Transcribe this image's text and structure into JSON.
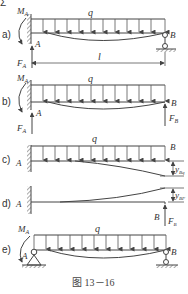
{
  "figure": {
    "caption": "图 13－16",
    "header_mark": "Σ"
  },
  "panels": [
    {
      "id": "a",
      "label": "a)",
      "load": "q",
      "moment": "M",
      "moment_sub": "A",
      "left": "A",
      "right": "B",
      "force": "F",
      "force_sub": "A",
      "length": "l"
    },
    {
      "id": "b",
      "label": "b)",
      "load": "q",
      "moment": "M",
      "moment_sub": "A",
      "left": "A",
      "right": "B",
      "force_left": "F",
      "force_left_sub": "A",
      "force_right": "F",
      "force_right_sub": "B"
    },
    {
      "id": "c",
      "label": "c)",
      "load": "q",
      "left": "A",
      "right": "B",
      "defl": "y",
      "defl_sub": "Bq"
    },
    {
      "id": "d",
      "label": "d)",
      "left": "A",
      "right": "B",
      "defl": "y",
      "defl_sub": "BF",
      "force": "F",
      "force_sub": "B"
    },
    {
      "id": "e",
      "label": "e)",
      "load": "q",
      "moment": "M",
      "moment_sub": "A",
      "left": "A",
      "right": "B"
    }
  ]
}
